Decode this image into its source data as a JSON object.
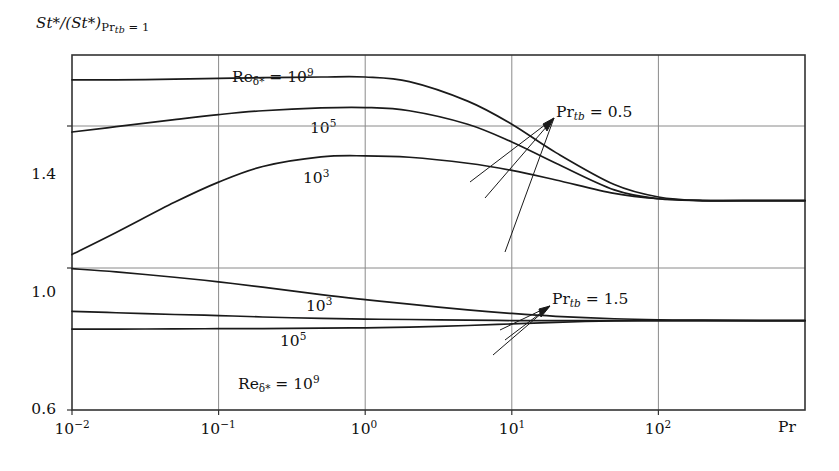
{
  "figure": {
    "y_axis_label_parts": {
      "numerator": "St",
      "numerator_star": "*",
      "denominator_open": "/(St",
      "denominator_star": "*",
      "denominator_close": ")",
      "subscript_pr": "Pr",
      "subscript_tb": "tb",
      "subscript_eq": " = 1"
    },
    "y_axis_label_plain": "St*/(St*)Prtb = 1",
    "x_axis_name": "Pr",
    "y_ticks": [
      {
        "label": "1.4",
        "value": 1.4
      },
      {
        "label": "1.0",
        "value": 1.0
      },
      {
        "label": "0.6",
        "value": 0.6
      }
    ],
    "x_ticks": [
      {
        "base": "10",
        "exp": "−2",
        "value": 0.01
      },
      {
        "base": "10",
        "exp": "−1",
        "value": 0.1
      },
      {
        "base": "10",
        "exp": "0",
        "value": 1
      },
      {
        "base": "10",
        "exp": "1",
        "value": 10
      },
      {
        "base": "10",
        "exp": "2",
        "value": 100
      }
    ],
    "curve_labels": [
      {
        "id": "upper-re9",
        "prefix": "Re",
        "sub": "δ*",
        "eq": " = 10",
        "exp": "9",
        "x": 232,
        "y": 66
      },
      {
        "id": "upper-re5",
        "prefix": "",
        "sub": "",
        "eq": "10",
        "exp": "5",
        "x": 310,
        "y": 117
      },
      {
        "id": "upper-re3",
        "prefix": "",
        "sub": "",
        "eq": "10",
        "exp": "3",
        "x": 303,
        "y": 167
      },
      {
        "id": "lower-re3",
        "prefix": "",
        "sub": "",
        "eq": "10",
        "exp": "3",
        "x": 306,
        "y": 295
      },
      {
        "id": "lower-re5",
        "prefix": "",
        "sub": "",
        "eq": "10",
        "exp": "5",
        "x": 280,
        "y": 330
      },
      {
        "id": "lower-re9",
        "prefix": "Re",
        "sub": "δ*",
        "eq": " = 10",
        "exp": "9",
        "x": 238,
        "y": 373
      }
    ],
    "annotations": [
      {
        "id": "pr-upper",
        "prefix": "Pr",
        "sub": "tb",
        "value": " = 0.5",
        "x": 556,
        "y": 103
      },
      {
        "id": "pr-lower",
        "prefix": "Pr",
        "sub": "tb",
        "value": " = 1.5",
        "x": 552,
        "y": 290
      }
    ],
    "colors": {
      "curve": "#1a1a1a",
      "frame": "#333333",
      "grid": "#8a8a8a",
      "background": "#ffffff",
      "text": "#111111"
    }
  },
  "chart_data": {
    "type": "line",
    "title": "",
    "xlabel": "Pr",
    "ylabel": "St*/(St*)Pr_tb = 1",
    "xscale": "log",
    "yscale": "linear",
    "xlim": [
      0.01,
      1000
    ],
    "ylim": [
      0.6,
      1.6
    ],
    "grid": true,
    "grid_x_values": [
      0.01,
      0.1,
      1,
      10,
      100
    ],
    "grid_y_values": [
      1.0,
      1.4
    ],
    "legend_position": "inline-curve-labels",
    "series": [
      {
        "name": "Pr_tb = 0.5, Re_delta* = 10^9",
        "group": "Pr_tb = 0.5",
        "reynolds": "10^9",
        "x": [
          0.01,
          0.02,
          0.05,
          0.1,
          0.2,
          0.5,
          1,
          2,
          5,
          10,
          20,
          50,
          100,
          200,
          500,
          1000
        ],
        "y": [
          1.53,
          1.53,
          1.532,
          1.534,
          1.536,
          1.538,
          1.538,
          1.525,
          1.47,
          1.405,
          1.325,
          1.235,
          1.2,
          1.19,
          1.19,
          1.19
        ]
      },
      {
        "name": "Pr_tb = 0.5, Re_delta* = 10^5",
        "group": "Pr_tb = 0.5",
        "reynolds": "10^5",
        "x": [
          0.01,
          0.02,
          0.05,
          0.1,
          0.2,
          0.5,
          1,
          2,
          5,
          10,
          20,
          50,
          100,
          200,
          500,
          1000
        ],
        "y": [
          1.383,
          1.398,
          1.418,
          1.432,
          1.443,
          1.451,
          1.452,
          1.443,
          1.405,
          1.355,
          1.295,
          1.22,
          1.195,
          1.19,
          1.19,
          1.19
        ]
      },
      {
        "name": "Pr_tb = 0.5, Re_delta* = 10^3",
        "group": "Pr_tb = 0.5",
        "reynolds": "10^3",
        "x": [
          0.01,
          0.02,
          0.05,
          0.1,
          0.2,
          0.5,
          1,
          2,
          5,
          10,
          20,
          50,
          100,
          200,
          500,
          1000
        ],
        "y": [
          1.038,
          1.1,
          1.185,
          1.242,
          1.286,
          1.313,
          1.316,
          1.312,
          1.295,
          1.275,
          1.248,
          1.21,
          1.195,
          1.19,
          1.19,
          1.19
        ]
      },
      {
        "name": "Pr_tb = 1.5, Re_delta* = 10^3",
        "group": "Pr_tb = 1.5",
        "reynolds": "10^3",
        "x": [
          0.01,
          0.02,
          0.05,
          0.1,
          0.2,
          0.5,
          1,
          2,
          5,
          10,
          20,
          50,
          100,
          200,
          500,
          1000
        ],
        "y": [
          0.998,
          0.989,
          0.974,
          0.961,
          0.946,
          0.925,
          0.911,
          0.898,
          0.882,
          0.872,
          0.864,
          0.857,
          0.854,
          0.853,
          0.852,
          0.852
        ]
      },
      {
        "name": "Pr_tb = 1.5, Re_delta* = 10^5",
        "group": "Pr_tb = 1.5",
        "reynolds": "10^5",
        "x": [
          0.01,
          0.02,
          0.05,
          0.1,
          0.2,
          0.5,
          1,
          2,
          5,
          10,
          20,
          50,
          100,
          200,
          500,
          1000
        ],
        "y": [
          0.878,
          0.874,
          0.869,
          0.866,
          0.862,
          0.858,
          0.856,
          0.855,
          0.853,
          0.852,
          0.852,
          0.852,
          0.852,
          0.852,
          0.852,
          0.852
        ]
      },
      {
        "name": "Pr_tb = 1.5, Re_delta* = 10^9",
        "group": "Pr_tb = 1.5",
        "reynolds": "10^9",
        "x": [
          0.01,
          0.02,
          0.05,
          0.1,
          0.2,
          0.5,
          1,
          2,
          5,
          10,
          20,
          50,
          100,
          200,
          500,
          1000
        ],
        "y": [
          0.828,
          0.828,
          0.8285,
          0.829,
          0.8295,
          0.8305,
          0.8315,
          0.8335,
          0.838,
          0.8425,
          0.847,
          0.851,
          0.8515,
          0.852,
          0.852,
          0.852
        ]
      }
    ]
  }
}
